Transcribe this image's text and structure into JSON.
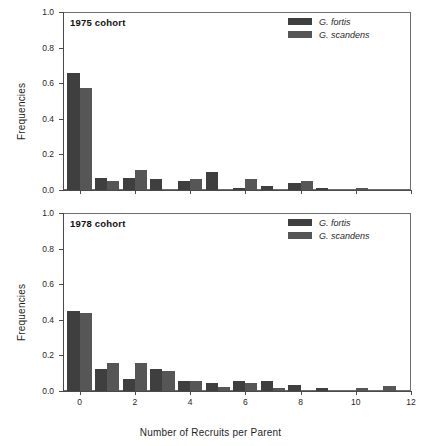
{
  "figure": {
    "xlabel": "Number of Recruits per Parent",
    "ylabel": "Frequencies"
  },
  "colors": {
    "fortis": "#3f3f3f",
    "scandens": "#565656",
    "axis": "#4a4a4a",
    "frame": "#6e6e6e",
    "text": "#1f1f1f"
  },
  "axes": {
    "y_ticks": [
      "0.0",
      "0.2",
      "0.4",
      "0.6",
      "0.8",
      "1.0"
    ],
    "x_ticks": [
      "0",
      "2",
      "4",
      "6",
      "8",
      "10",
      "12"
    ]
  },
  "legend": {
    "entries": [
      {
        "label": "G. fortis",
        "series": "fortis"
      },
      {
        "label": "G. scandens",
        "series": "scandens"
      }
    ]
  },
  "panels": [
    {
      "id": "panel-1975",
      "title": "1975 cohort"
    },
    {
      "id": "panel-1978",
      "title": "1978 cohort"
    }
  ],
  "chart_data": [
    {
      "type": "bar",
      "title": "1975 cohort",
      "xlabel": "",
      "ylabel": "Frequencies",
      "xlim": [
        -0.6,
        12
      ],
      "ylim": [
        0.0,
        1.0
      ],
      "grid": false,
      "legend_position": "top-right",
      "categories": [
        0,
        1,
        2,
        3,
        4,
        5,
        6,
        7,
        8,
        9,
        10,
        11
      ],
      "series": [
        {
          "name": "G. fortis",
          "values": [
            0.66,
            0.07,
            0.07,
            0.06,
            0.05,
            0.1,
            0.01,
            0.02,
            0.04,
            0.01,
            0.0,
            0.0
          ]
        },
        {
          "name": "G. scandens",
          "values": [
            0.575,
            0.05,
            0.11,
            0.0,
            0.06,
            0.0,
            0.06,
            0.0,
            0.05,
            0.0,
            0.01,
            0.0
          ]
        }
      ]
    },
    {
      "type": "bar",
      "title": "1978 cohort",
      "xlabel": "Number of Recruits per Parent",
      "ylabel": "Frequencies",
      "xlim": [
        -0.6,
        12
      ],
      "ylim": [
        0.0,
        1.0
      ],
      "grid": false,
      "legend_position": "top-right",
      "categories": [
        0,
        1,
        2,
        3,
        4,
        5,
        6,
        7,
        8,
        9,
        10,
        11
      ],
      "series": [
        {
          "name": "G. fortis",
          "values": [
            0.45,
            0.125,
            0.065,
            0.125,
            0.055,
            0.045,
            0.055,
            0.055,
            0.035,
            0.015,
            0.0,
            0.0
          ]
        },
        {
          "name": "G. scandens",
          "values": [
            0.44,
            0.16,
            0.16,
            0.115,
            0.055,
            0.025,
            0.047,
            0.015,
            0.0,
            0.0,
            0.015,
            0.027
          ]
        }
      ]
    }
  ]
}
